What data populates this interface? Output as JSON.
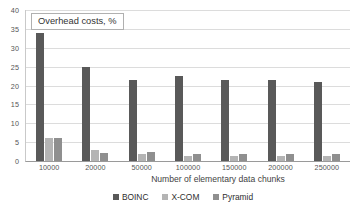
{
  "chart_data": {
    "type": "bar",
    "title": "Overhead costs, %",
    "xlabel": "Number of elementary data chunks",
    "ylabel": "",
    "categories": [
      "10000",
      "20000",
      "50000",
      "100000",
      "150000",
      "200000",
      "250000"
    ],
    "series": [
      {
        "name": "BOINC",
        "color": "#595959",
        "values": [
          34.0,
          25.0,
          21.5,
          22.5,
          21.5,
          21.5,
          20.8
        ]
      },
      {
        "name": "X-COM",
        "color": "#b4b4b4",
        "values": [
          6.0,
          3.0,
          1.8,
          1.3,
          1.2,
          1.2,
          1.2
        ]
      },
      {
        "name": "Pyramid",
        "color": "#8f8f8f",
        "values": [
          6.2,
          2.2,
          2.5,
          1.8,
          1.8,
          1.8,
          1.8
        ]
      }
    ],
    "ylim": [
      0,
      40
    ],
    "yticks": [
      0,
      5,
      10,
      15,
      20,
      25,
      30,
      35,
      40
    ],
    "ytick_labels": [
      "0",
      "5",
      "10",
      "15",
      "20",
      "25",
      "30",
      "35",
      "40"
    ],
    "grid": true,
    "legend_position": "bottom"
  }
}
